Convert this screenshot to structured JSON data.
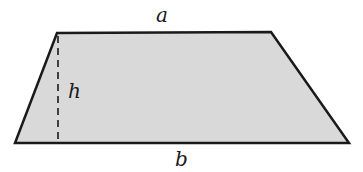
{
  "diagram": {
    "type": "trapezoid",
    "fill_color": "#d9d9d9",
    "stroke_color": "#1a1a1a",
    "vertices": {
      "top_left": [
        57,
        33
      ],
      "top_right": [
        271,
        32
      ],
      "bottom_right": [
        349,
        143
      ],
      "bottom_left": [
        15,
        143
      ]
    },
    "height_line": {
      "x": 58,
      "y1": 35,
      "y2": 143,
      "style": "dashed"
    },
    "labels": {
      "top_base": "a",
      "bottom_base": "b",
      "height": "h"
    }
  }
}
